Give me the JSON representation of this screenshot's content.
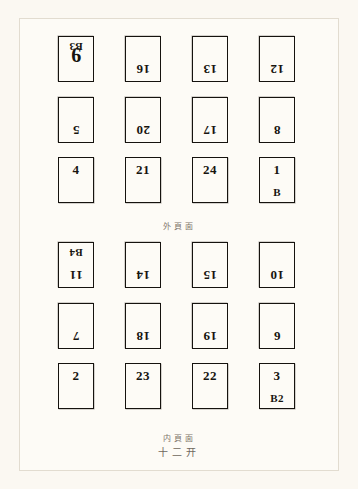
{
  "document": {
    "type": "printing-imposition-diagram",
    "format_label": "十二开",
    "background_color": "#fbf8f2",
    "ink_color": "#15120e"
  },
  "sections": [
    {
      "id": "outer",
      "caption": "外頁面",
      "rows": [
        {
          "rotated": true,
          "cells": [
            {
              "folio": "9",
              "signature": "B3",
              "big": true
            },
            {
              "folio": "16",
              "signature": "",
              "big": false
            },
            {
              "folio": "13",
              "signature": "",
              "big": false
            },
            {
              "folio": "12",
              "signature": "",
              "big": false
            }
          ]
        },
        {
          "rotated": true,
          "cells": [
            {
              "folio": "5",
              "signature": "",
              "big": false
            },
            {
              "folio": "20",
              "signature": "",
              "big": false
            },
            {
              "folio": "17",
              "signature": "",
              "big": false
            },
            {
              "folio": "8",
              "signature": "",
              "big": false
            }
          ]
        },
        {
          "rotated": false,
          "cells": [
            {
              "folio": "4",
              "signature": "",
              "big": false
            },
            {
              "folio": "21",
              "signature": "",
              "big": false
            },
            {
              "folio": "24",
              "signature": "",
              "big": false
            },
            {
              "folio": "1",
              "signature": "B",
              "big": false
            }
          ]
        }
      ]
    },
    {
      "id": "inner",
      "caption": "内頁面",
      "rows": [
        {
          "rotated": true,
          "cells": [
            {
              "folio": "11",
              "signature": "B4",
              "big": false
            },
            {
              "folio": "14",
              "signature": "",
              "big": false
            },
            {
              "folio": "15",
              "signature": "",
              "big": false
            },
            {
              "folio": "10",
              "signature": "",
              "big": false
            }
          ]
        },
        {
          "rotated": true,
          "cells": [
            {
              "folio": "7",
              "signature": "",
              "big": false
            },
            {
              "folio": "18",
              "signature": "",
              "big": false
            },
            {
              "folio": "19",
              "signature": "",
              "big": false
            },
            {
              "folio": "6",
              "signature": "",
              "big": false
            }
          ]
        },
        {
          "rotated": false,
          "cells": [
            {
              "folio": "2",
              "signature": "",
              "big": false
            },
            {
              "folio": "23",
              "signature": "",
              "big": false
            },
            {
              "folio": "22",
              "signature": "",
              "big": false
            },
            {
              "folio": "3",
              "signature": "B2",
              "big": false
            }
          ]
        }
      ]
    }
  ]
}
